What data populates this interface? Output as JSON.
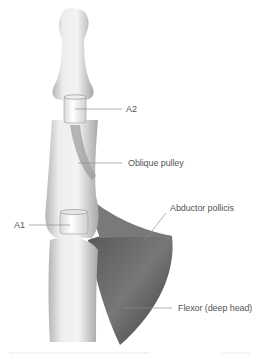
{
  "figure": {
    "labels": [
      {
        "id": "a2",
        "text": "A2"
      },
      {
        "id": "oblique",
        "text": "Oblique pulley"
      },
      {
        "id": "a1",
        "text": "A1"
      },
      {
        "id": "abductor",
        "text": "Abductor pollicis"
      },
      {
        "id": "flexor",
        "text": "Flexor (deep head)"
      }
    ]
  },
  "colors": {
    "bone_light": "#f4f4f4",
    "bone_shade": "#bdbdbd",
    "muscle_dark": "#4a4a4a",
    "muscle_mid": "#8a8a8a",
    "leader_line": "#8c8c8c",
    "label_text": "#555555",
    "dotted_rule": "#c8c8c8"
  }
}
